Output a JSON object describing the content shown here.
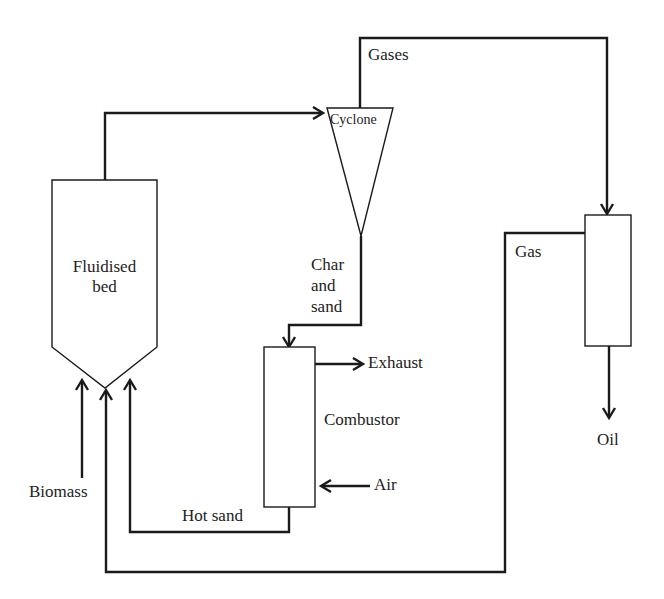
{
  "diagram": {
    "units": {
      "fluidised_bed": {
        "label_line1": "Fluidised",
        "label_line2": "bed"
      },
      "cyclone": {
        "label": "Cyclone"
      },
      "combustor": {
        "label": "Combustor"
      },
      "condenser": {
        "label": ""
      }
    },
    "streams": {
      "gases": "Gases",
      "gas": "Gas",
      "oil": "Oil",
      "char_line1": "Char",
      "char_line2": "and",
      "char_line3": "sand",
      "exhaust": "Exhaust",
      "air": "Air",
      "hot_sand": "Hot sand",
      "biomass": "Biomass"
    },
    "colors": {
      "line": "#1a1a1a",
      "text": "#222222",
      "background": "#ffffff"
    }
  }
}
